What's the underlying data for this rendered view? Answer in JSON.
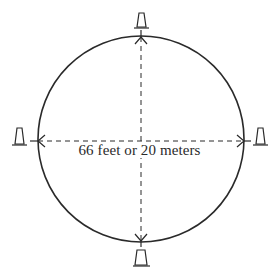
{
  "diagram": {
    "diameter_label": "66 feet or 20 meters",
    "shapes": {
      "circle": {
        "cx": 141,
        "cy": 139,
        "r": 103
      },
      "cones": [
        "top",
        "right",
        "bottom",
        "left"
      ],
      "axes": [
        "vertical-diameter",
        "horizontal-diameter"
      ]
    },
    "colors": {
      "stroke": "#2a2a2a",
      "background": "#ffffff"
    }
  }
}
